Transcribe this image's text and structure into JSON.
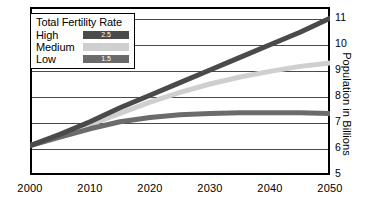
{
  "chart_data": {
    "type": "line",
    "title": "",
    "xlabel": "",
    "ylabel": "Population in Billions",
    "xlim": [
      2000,
      2050
    ],
    "ylim": [
      5,
      11
    ],
    "grid": true,
    "legend_position": "top-left",
    "legend_title": "Total Fertility Rate",
    "x": [
      2000,
      2005,
      2010,
      2015,
      2020,
      2025,
      2030,
      2035,
      2040,
      2045,
      2050
    ],
    "xticks": [
      "2000",
      "2010",
      "2020",
      "2030",
      "2040",
      "2050"
    ],
    "yticks": [
      "5",
      "6",
      "7",
      "8",
      "9",
      "10",
      "11"
    ],
    "series": [
      {
        "name": "High",
        "fertility_rate": "2.5",
        "color": "#4a4a4a",
        "values": [
          6.05,
          6.45,
          6.9,
          7.4,
          7.85,
          8.3,
          8.75,
          9.2,
          9.65,
          10.1,
          10.6
        ]
      },
      {
        "name": "Medium",
        "fertility_rate": "2.0",
        "color": "#cfcfcf",
        "values": [
          6.05,
          6.4,
          6.8,
          7.2,
          7.6,
          7.95,
          8.25,
          8.5,
          8.7,
          8.88,
          9.0
        ]
      },
      {
        "name": "Low",
        "fertility_rate": "1.5",
        "color": "#6b6b6b",
        "values": [
          6.05,
          6.35,
          6.65,
          6.9,
          7.05,
          7.15,
          7.2,
          7.22,
          7.22,
          7.22,
          7.2
        ]
      }
    ]
  },
  "axes": {
    "y_title": "Population in Billions"
  },
  "legend": {
    "title": "Total Fertility Rate",
    "rows": [
      {
        "label": "High",
        "value": "2.5"
      },
      {
        "label": "Medium",
        "value": "2.0"
      },
      {
        "label": "Low",
        "value": "1.5"
      }
    ]
  }
}
